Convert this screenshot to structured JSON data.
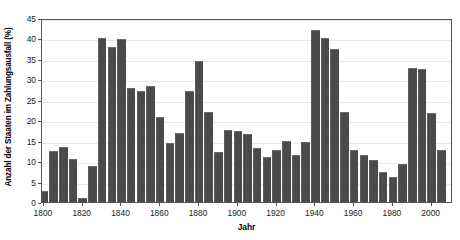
{
  "chart_data": {
    "type": "bar",
    "title": "",
    "subtitle": "",
    "xlabel": "Jahr",
    "ylabel": "Anzahl der Staaten im Zahlungsausfall (%)",
    "xlim": [
      1799,
      2011
    ],
    "ylim": [
      0,
      45
    ],
    "grid": true,
    "legend": null,
    "bar_color": "#4a4a4a",
    "axis_color": "#555555",
    "grid_color": "#e9e9e9",
    "background": "#ffffff",
    "yticks": [
      0,
      5,
      10,
      15,
      20,
      25,
      30,
      35,
      40,
      45
    ],
    "ytick_labels": [
      "0",
      "5",
      "10",
      "15",
      "20",
      "25",
      "30",
      "35",
      "40",
      "45"
    ],
    "xticks": [
      1800,
      1820,
      1840,
      1860,
      1880,
      1900,
      1920,
      1940,
      1960,
      1980,
      2000
    ],
    "xtick_labels": [
      "1800",
      "1820",
      "1840",
      "1860",
      "1880",
      "1900",
      "1920",
      "1940",
      "1960",
      "1980",
      "2000"
    ],
    "bar_width_years": 5,
    "x": [
      1800,
      1805,
      1810,
      1815,
      1820,
      1825,
      1830,
      1835,
      1840,
      1845,
      1850,
      1855,
      1860,
      1865,
      1870,
      1875,
      1880,
      1885,
      1890,
      1895,
      1900,
      1905,
      1910,
      1915,
      1920,
      1925,
      1930,
      1935,
      1940,
      1945,
      1950,
      1955,
      1960,
      1965,
      1970,
      1975,
      1980,
      1985,
      1990,
      1995,
      2000,
      2005
    ],
    "categories": [
      "1800",
      "1805",
      "1810",
      "1815",
      "1820",
      "1825",
      "1830",
      "1835",
      "1840",
      "1845",
      "1850",
      "1855",
      "1860",
      "1865",
      "1870",
      "1875",
      "1880",
      "1885",
      "1890",
      "1895",
      "1900",
      "1905",
      "1910",
      "1915",
      "1920",
      "1925",
      "1930",
      "1935",
      "1940",
      "1945",
      "1950",
      "1955",
      "1960",
      "1965",
      "1970",
      "1975",
      "1980",
      "1985",
      "1990",
      "1995",
      "2000",
      "2005"
    ],
    "values": [
      2.7,
      12.4,
      13.5,
      10.6,
      0.9,
      8.8,
      40.2,
      38.0,
      39.9,
      27.8,
      27.2,
      28.3,
      20.8,
      14.5,
      17.0,
      27.1,
      34.4,
      22.0,
      12.3,
      17.6,
      17.3,
      16.7,
      13.3,
      11.1,
      12.8,
      15.0,
      11.6,
      14.8,
      42.0,
      40.2,
      37.4,
      22.0,
      12.6,
      11.4,
      10.3,
      7.4,
      6.2,
      9.4,
      32.7,
      32.5,
      21.8,
      12.8
    ]
  }
}
